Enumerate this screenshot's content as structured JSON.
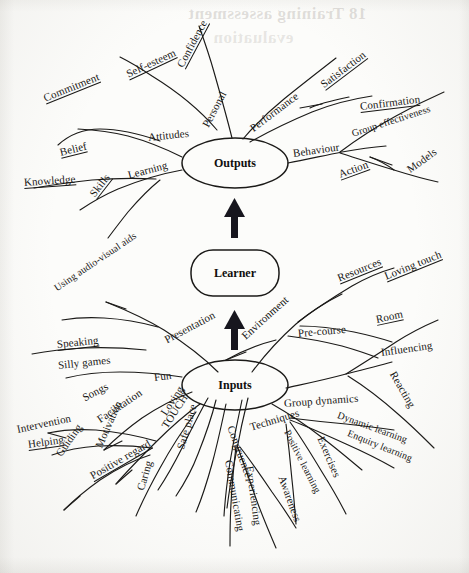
{
  "document": {
    "type": "hand-drawn mind map diagram (scanned book page)",
    "bleed_through": [
      {
        "text": "18 Training assessment",
        "x": 188,
        "y": 10,
        "size": 17
      },
      {
        "text": "evaluation",
        "x": 213,
        "y": 35,
        "size": 17
      }
    ]
  },
  "hubs": {
    "outputs": {
      "label": "Outputs",
      "cx": 235,
      "cy": 163,
      "rx": 53,
      "ry": 25
    },
    "learner": {
      "label": "Learner",
      "cx": 235,
      "cy": 273,
      "w": 88,
      "h": 46
    },
    "inputs": {
      "label": "Inputs",
      "cx": 235,
      "cy": 385,
      "rx": 53,
      "ry": 25
    }
  },
  "flow": {
    "arrow_lower": {
      "from": "Inputs",
      "to": "Learner",
      "direction": "up"
    },
    "arrow_upper": {
      "from": "Learner",
      "to": "Outputs",
      "direction": "up"
    }
  },
  "branches": {
    "outputs": [
      {
        "label": "Personal",
        "x": 205,
        "y": 120,
        "rot": -62,
        "underline": false
      },
      {
        "label": "Confidence",
        "x": 180,
        "y": 60,
        "rot": -62,
        "underline": true
      },
      {
        "label": "Self-esteem",
        "x": 127,
        "y": 68,
        "rot": -25,
        "underline": true
      },
      {
        "label": "Performance",
        "x": 251,
        "y": 123,
        "rot": -37,
        "underline": false
      },
      {
        "label": "Satisfaction",
        "x": 322,
        "y": 79,
        "rot": -37,
        "underline": true
      },
      {
        "label": "Confirmation",
        "x": 360,
        "y": 100,
        "rot": -7,
        "underline": true
      },
      {
        "label": "Attitudes",
        "x": 148,
        "y": 131,
        "rot": -6,
        "underline": false
      },
      {
        "label": "Commitment",
        "x": 44,
        "y": 92,
        "rot": -22,
        "underline": true
      },
      {
        "label": "Belief",
        "x": 60,
        "y": 146,
        "rot": -14,
        "underline": true
      },
      {
        "label": "Learning",
        "x": 128,
        "y": 169,
        "rot": -15,
        "underline": false
      },
      {
        "label": "Knowledge",
        "x": 24,
        "y": 176,
        "rot": -4,
        "underline": true
      },
      {
        "label": "Skills",
        "x": 92,
        "y": 189,
        "rot": -52,
        "underline": true
      },
      {
        "label": "Behaviour",
        "x": 293,
        "y": 147,
        "rot": -8,
        "underline": false
      },
      {
        "label": "Group effectiveness",
        "x": 352,
        "y": 128,
        "rot": -18,
        "underline": false
      },
      {
        "label": "Action",
        "x": 339,
        "y": 168,
        "rot": -20,
        "underline": true
      },
      {
        "label": "Models",
        "x": 408,
        "y": 164,
        "rot": -36,
        "underline": false
      }
    ],
    "inputs": [
      {
        "label": "Presentation",
        "x": 165,
        "y": 334,
        "rot": -28,
        "underline": false
      },
      {
        "label": "Using audio-visual aids",
        "x": 55,
        "y": 283,
        "rot": -34,
        "underline": false
      },
      {
        "label": "Speaking",
        "x": 57,
        "y": 338,
        "rot": -6,
        "underline": true
      },
      {
        "label": "Silly games",
        "x": 58,
        "y": 359,
        "rot": -6,
        "underline": false
      },
      {
        "label": "Fun",
        "x": 154,
        "y": 371,
        "rot": -7,
        "underline": false
      },
      {
        "label": "Songs",
        "x": 83,
        "y": 392,
        "rot": -28,
        "underline": false
      },
      {
        "label": "Facilitation",
        "x": 98,
        "y": 414,
        "rot": -34,
        "underline": false
      },
      {
        "label": "Intervention",
        "x": 17,
        "y": 423,
        "rot": -12,
        "underline": false
      },
      {
        "label": "Helping",
        "x": 28,
        "y": 438,
        "rot": -8,
        "underline": true
      },
      {
        "label": "Guiding",
        "x": 58,
        "y": 449,
        "rot": -55,
        "underline": false
      },
      {
        "label": "Motivation",
        "x": 98,
        "y": 441,
        "rot": -66,
        "underline": false
      },
      {
        "label": "Positive regard",
        "x": 91,
        "y": 470,
        "rot": -30,
        "underline": true
      },
      {
        "label": "Loving",
        "x": 163,
        "y": 408,
        "rot": -57,
        "underline": false
      },
      {
        "label": "TOUCH",
        "x": 164,
        "y": 421,
        "rot": -57,
        "underline": false
      },
      {
        "label": "Caring",
        "x": 140,
        "y": 484,
        "rot": -74,
        "underline": false
      },
      {
        "label": "Safe place",
        "x": 180,
        "y": 443,
        "rot": -74,
        "underline": false
      },
      {
        "label": "Environment",
        "x": 243,
        "y": 331,
        "rot": -42,
        "underline": false
      },
      {
        "label": "Resources",
        "x": 338,
        "y": 272,
        "rot": -22,
        "underline": true
      },
      {
        "label": "Loving touch",
        "x": 385,
        "y": 270,
        "rot": -22,
        "underline": true
      },
      {
        "label": "Room",
        "x": 376,
        "y": 313,
        "rot": -12,
        "underline": true
      },
      {
        "label": "Pre-course",
        "x": 298,
        "y": 327,
        "rot": -5,
        "underline": false
      },
      {
        "label": "Influencing",
        "x": 381,
        "y": 346,
        "rot": -8,
        "underline": false
      },
      {
        "label": "Reacting",
        "x": 393,
        "y": 366,
        "rot": 60,
        "underline": false
      },
      {
        "label": "Group dynamics",
        "x": 284,
        "y": 397,
        "rot": -4,
        "underline": false
      },
      {
        "label": "Techniques",
        "x": 250,
        "y": 421,
        "rot": -17,
        "underline": false
      },
      {
        "label": "Congruence",
        "x": 231,
        "y": 420,
        "rot": 70,
        "underline": false
      },
      {
        "label": "Communicating",
        "x": 229,
        "y": 454,
        "rot": 80,
        "underline": false
      },
      {
        "label": "Experiencing",
        "x": 250,
        "y": 460,
        "rot": 82,
        "underline": false
      },
      {
        "label": "Awareness",
        "x": 282,
        "y": 470,
        "rot": 70,
        "underline": false
      },
      {
        "label": "Positive learning",
        "x": 287,
        "y": 425,
        "rot": 63,
        "underline": false
      },
      {
        "label": "Exercises",
        "x": 321,
        "y": 431,
        "rot": 67,
        "underline": false
      },
      {
        "label": "Dynamic learning",
        "x": 338,
        "y": 409,
        "rot": 20,
        "underline": false
      },
      {
        "label": "Enquiry learning",
        "x": 348,
        "y": 427,
        "rot": 22,
        "underline": false
      }
    ]
  },
  "strokes": {
    "outputs_curves": [
      "M 232 138 C 228 122 222 100 214 72 C 209 54 204 40 199 26",
      "M 217 130 C 200 110 178 92 152 76 C 140 68 130 62 120 57",
      "M 243 139 C 254 126 268 112 284 99 C 300 86 318 72 336 58",
      "M 250 142 C 268 132 288 122 312 112 C 332 104 352 99 372 96",
      "M 349 97 C 330 101 318 104 310 108",
      "M 182 157 C 168 150 150 142 128 136 C 112 132 96 130 78 129",
      "M 160 141 C 140 134 120 129 100 129 C 84 129 70 134 58 145",
      "M 182 170 C 160 174 140 180 118 189 C 104 195 92 202 80 210",
      "M 156 179 C 136 178 116 178 92 180 C 72 182 52 185 34 188",
      "M 160 180 C 150 188 140 198 128 212 C 120 222 114 230 108 238",
      "M 288 163 C 304 160 322 156 342 152 C 358 149 372 147 386 146",
      "M 340 152 C 356 140 374 128 396 116 C 412 107 428 99 444 92",
      "M 340 153 C 356 158 374 164 394 170 C 410 175 424 179 438 182",
      "M 394 170 C 386 164 378 160 370 157"
    ],
    "inputs_curves": [
      "M 218 372 C 204 358 186 344 164 330 C 146 319 126 310 106 302",
      "M 158 327 C 140 322 122 319 104 318 C 88 317 74 318 62 320",
      "M 146 350 C 126 348 106 347 84 348 C 66 349 48 351 32 354",
      "M 182 377 C 162 374 142 372 120 372 C 100 372 82 374 66 378",
      "M 192 392 C 176 398 160 406 142 418 C 128 428 116 438 104 450",
      "M 200 404 C 186 414 172 426 156 442 C 142 456 128 470 116 484",
      "M 156 441 C 138 436 118 432 96 430 C 78 429 62 430 48 433",
      "M 152 448 C 136 446 118 445 98 446 C 82 447 66 450 52 455",
      "M 150 455 C 134 460 118 468 100 480 C 86 490 74 500 64 510",
      "M 208 398 C 200 412 192 428 182 448 C 174 464 166 478 158 490",
      "M 216 400 C 212 416 206 434 198 454 C 192 470 184 484 176 496",
      "M 226 404 C 222 422 218 442 212 464 C 207 482 202 498 196 512",
      "M 196 412 C 184 428 172 446 160 468 C 150 486 142 502 136 516",
      "M 252 372 C 264 356 278 340 296 324 C 310 312 326 302 342 294",
      "M 298 322 C 314 310 332 298 352 286 C 366 278 380 272 394 268",
      "M 300 326 C 316 326 334 328 354 332 C 368 335 380 338 392 342",
      "M 288 336 C 304 338 322 341 342 346 C 356 350 368 354 378 358",
      "M 276 340 C 260 344 244 350 226 360",
      "M 286 388 C 304 384 324 380 346 374 C 362 370 378 366 392 362",
      "M 346 374 C 362 364 378 354 396 342 C 410 333 424 326 438 320",
      "M 348 376 C 364 386 380 398 398 414 C 412 426 424 438 434 448",
      "M 272 404 C 286 412 302 422 320 436 C 336 448 350 460 362 470",
      "M 290 418 C 306 420 324 422 346 424 C 364 426 380 428 394 430",
      "M 290 420 C 306 426 324 434 346 444 C 364 452 380 460 394 468",
      "M 290 422 C 300 436 310 452 322 472 C 332 488 340 502 346 514",
      "M 286 424 C 288 440 290 458 292 480 C 294 498 295 512 296 524",
      "M 248 398 C 244 414 240 432 236 454 C 232 474 229 492 227 508",
      "M 242 400 C 238 418 234 438 230 462 C 227 482 225 500 224 516",
      "M 236 446 C 234 464 232 482 231 504 C 230 520 230 534 230 546",
      "M 238 448 C 244 464 250 482 258 504 C 264 520 270 534 276 548",
      "M 240 447 C 250 460 260 474 272 492 C 282 506 290 518 296 528"
    ],
    "tick_marks": [
      "M 300 108 L 322 104",
      "M 370 157 L 392 165",
      "M 106 302 L 126 309",
      "M 226 360 L 246 352",
      "M 48 433 L 66 438",
      "M 104 450 L 122 441",
      "M 116 484 L 132 470",
      "M 64 510 L 80 496"
    ]
  }
}
